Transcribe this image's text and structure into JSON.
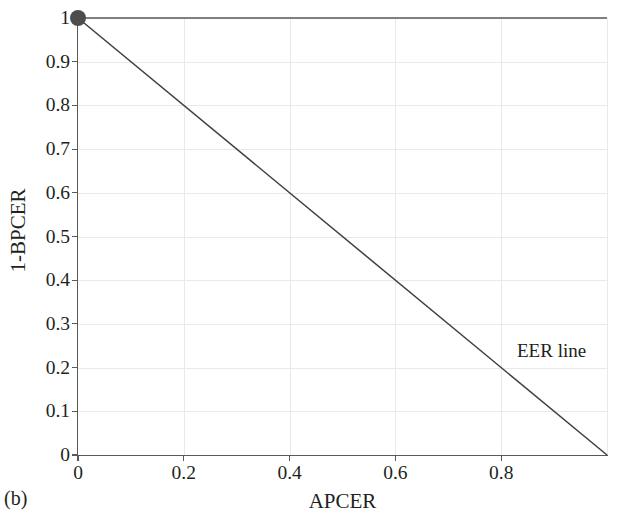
{
  "figure": {
    "subfigure_label": "(b)",
    "background_color": "#ffffff"
  },
  "chart_data": {
    "type": "line",
    "title": "",
    "subtitle": "",
    "xlabel": "APCER",
    "ylabel": "1-BPCER",
    "xlim": [
      0,
      1
    ],
    "ylim": [
      0,
      1
    ],
    "grid": true,
    "legend_position": "none",
    "xticks": [
      0,
      0.2,
      0.4,
      0.6,
      0.8
    ],
    "xticklabels": [
      "0",
      "0.2",
      "0.4",
      "0.6",
      "0.8"
    ],
    "yticks": [
      0,
      0.1,
      0.2,
      0.3,
      0.4,
      0.5,
      0.6,
      0.7,
      0.8,
      0.9,
      1
    ],
    "yticklabels": [
      "0",
      "0.1",
      "0.2",
      "0.3",
      "0.4",
      "0.5",
      "0.6",
      "0.7",
      "0.8",
      "0.9",
      "1"
    ],
    "series": [
      {
        "name": "DET curve",
        "type": "line",
        "color": "#58595b",
        "linewidth": 1.6,
        "x": [
          0,
          1
        ],
        "y": [
          1,
          1
        ],
        "marker": {
          "shape": "circle",
          "color": "#4d4d4d",
          "size": 16,
          "at": [
            0,
            1
          ]
        }
      },
      {
        "name": "EER line",
        "type": "line",
        "color": "#3f3f3f",
        "linewidth": 1.5,
        "x": [
          0,
          1
        ],
        "y": [
          1,
          0
        ],
        "marker": null
      }
    ],
    "annotations": [
      {
        "text": "EER line",
        "x": 0.83,
        "y": 0.225,
        "color": "#231f20"
      }
    ],
    "gridline_color": "#e9e9e9",
    "axis_color": "#58595b"
  }
}
